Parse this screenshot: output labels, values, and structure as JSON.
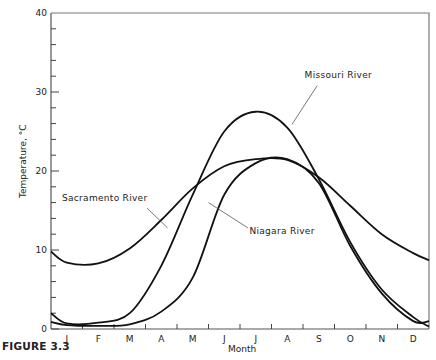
{
  "figure_label": "FIGURE 3.3",
  "chart_data": {
    "type": "line",
    "title": "",
    "xlabel": "Month",
    "ylabel": "Temperature, °C",
    "ylim": [
      0,
      40
    ],
    "yticks_major": [
      0,
      10,
      20,
      30,
      40
    ],
    "ytick_minor_step": 2,
    "grid": false,
    "legend": "inline annotations",
    "categories": [
      "J",
      "F",
      "M",
      "A",
      "M",
      "J",
      "J",
      "A",
      "S",
      "O",
      "N",
      "D"
    ],
    "series": [
      {
        "name": "Missouri River",
        "values": [
          0.7,
          0.8,
          2.0,
          8.0,
          17.0,
          25.0,
          27.5,
          25.5,
          19.0,
          11.0,
          5.0,
          1.5
        ],
        "start": 2.0,
        "end": 0.3
      },
      {
        "name": "Sacramento River",
        "values": [
          8.4,
          8.3,
          10.2,
          13.8,
          17.8,
          20.6,
          21.5,
          21.4,
          19.2,
          15.6,
          12.0,
          9.6
        ],
        "start": 9.8,
        "end": 8.7
      },
      {
        "name": "Niagara River",
        "values": [
          0.5,
          0.4,
          0.6,
          2.2,
          6.5,
          17.0,
          21.0,
          21.5,
          18.5,
          10.5,
          4.5,
          1.0
        ],
        "start": 0.9,
        "end": 1.0
      }
    ],
    "annotations": [
      {
        "text": "Missouri River",
        "x_month": 8.2,
        "y": 32
      },
      {
        "text": "Sacramento River",
        "x_month": 0.4,
        "y": 16
      },
      {
        "text": "Niagara River",
        "x_month": 5.5,
        "y": 12.5
      }
    ]
  }
}
